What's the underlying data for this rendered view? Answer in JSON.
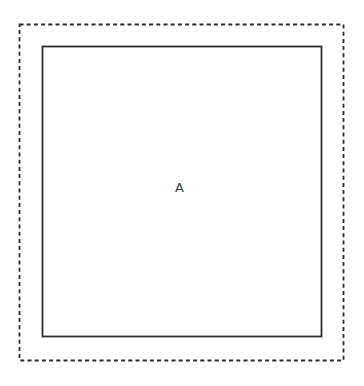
{
  "figure": {
    "label": "A",
    "colors": {
      "outer_border": "#2a2a2a",
      "inner_border": "#2e2e2e",
      "label_text": "#3a3a3a",
      "background": "#ffffff"
    }
  }
}
